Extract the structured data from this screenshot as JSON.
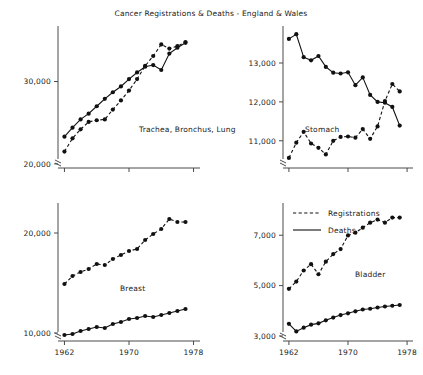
{
  "chart_data": {
    "type": "line",
    "title": "Cancer Registrations & Deaths - England & Wales",
    "xlabel": "",
    "ylabel": "",
    "grid": false,
    "legend_position": "bottom-right-panel",
    "legend": [
      {
        "name": "Registrations",
        "style": "dashed"
      },
      {
        "name": "Deaths",
        "style": "solid"
      }
    ],
    "x": [
      1962,
      1963,
      1964,
      1965,
      1966,
      1967,
      1968,
      1969,
      1970,
      1971,
      1972,
      1973,
      1974,
      1975,
      1976,
      1977
    ],
    "xlim": [
      1961.2,
      1978.8
    ],
    "xticks": [
      1962,
      1970,
      1978
    ],
    "xticklabels": [
      "1962",
      "1970",
      "1978"
    ],
    "panels": [
      {
        "label": "Trachea, Bronchus, Lung",
        "yticks": [
          20000,
          30000
        ],
        "yticklabels": [
          "20,000",
          "30,000"
        ],
        "ylim": [
          19500,
          36500
        ],
        "axis_break": true,
        "series": [
          {
            "name": "Registrations",
            "style": "dashed",
            "values": [
              21500,
              23100,
              24200,
              25100,
              25300,
              25400,
              26600,
              27700,
              28900,
              30300,
              31900,
              33100,
              34500,
              34000,
              34300,
              34800
            ]
          },
          {
            "name": "Deaths",
            "style": "solid",
            "values": [
              23300,
              24400,
              25400,
              26100,
              27000,
              27900,
              28700,
              29400,
              30300,
              31100,
              31800,
              32000,
              31400,
              33400,
              34100,
              34700
            ]
          }
        ]
      },
      {
        "label": "Stomach",
        "yticks": [
          11000,
          12000,
          13000
        ],
        "yticklabels": [
          "11,000",
          "12,000",
          "13,000"
        ],
        "ylim": [
          10300,
          13900
        ],
        "axis_break": true,
        "series": [
          {
            "name": "Registrations",
            "style": "dashed",
            "values": [
              10560,
              10950,
              11230,
              10930,
              10820,
              10650,
              11000,
              11100,
              11110,
              11080,
              11300,
              11050,
              11370,
              12020,
              12460,
              12270
            ]
          },
          {
            "name": "Deaths",
            "style": "solid",
            "values": [
              13620,
              13740,
              13150,
              13070,
              13180,
              12900,
              12750,
              12730,
              12760,
              12430,
              12630,
              12180,
              12000,
              11980,
              11870,
              11390
            ]
          }
        ]
      },
      {
        "label": "Breast",
        "yticks": [
          10000,
          20000
        ],
        "yticklabels": [
          "10,000",
          "20,000"
        ],
        "ylim": [
          9200,
          22800
        ],
        "axis_break": true,
        "series": [
          {
            "name": "Registrations",
            "style": "dashed",
            "values": [
              14900,
              15700,
              16100,
              16400,
              16900,
              16800,
              17400,
              17800,
              18200,
              18400,
              19300,
              19900,
              20400,
              21400,
              21100,
              21100
            ]
          },
          {
            "name": "Deaths",
            "style": "solid",
            "values": [
              9800,
              9900,
              10200,
              10400,
              10600,
              10500,
              10900,
              11100,
              11400,
              11500,
              11700,
              11600,
              11800,
              12000,
              12200,
              12400
            ]
          }
        ]
      },
      {
        "label": "Bladder",
        "yticks": [
          3000,
          5000,
          7000
        ],
        "yticklabels": [
          "3,000",
          "5,000",
          "7,000"
        ],
        "ylim": [
          2800,
          8200
        ],
        "axis_break": true,
        "series": [
          {
            "name": "Registrations",
            "style": "dashed",
            "values": [
              4870,
              5160,
              5600,
              5850,
              5450,
              5950,
              6250,
              6450,
              6990,
              7100,
              7300,
              7500,
              7620,
              7500,
              7700,
              7700
            ]
          },
          {
            "name": "Deaths",
            "style": "solid",
            "values": [
              3480,
              3180,
              3330,
              3450,
              3500,
              3620,
              3730,
              3830,
              3900,
              3980,
              4050,
              4080,
              4130,
              4170,
              4200,
              4230
            ]
          }
        ]
      }
    ]
  }
}
